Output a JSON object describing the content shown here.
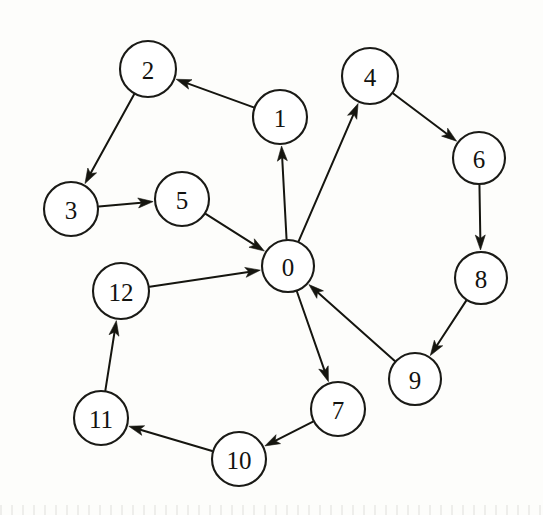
{
  "figure": {
    "name": "directed-graph",
    "width": 543,
    "height": 515,
    "background_color": "#fdfdfb",
    "stroke_color": "#15150f",
    "node_fill_color": "#ffffff"
  },
  "chart_data": {
    "type": "diagram",
    "subtype": "directed-graph",
    "title": "",
    "directed": true,
    "node_count": 13,
    "edge_count": 15,
    "nodes": [
      {
        "id": "0",
        "label": "0",
        "x": 288,
        "y": 266,
        "r": 26
      },
      {
        "id": "1",
        "label": "1",
        "x": 280,
        "y": 117,
        "r": 27
      },
      {
        "id": "2",
        "label": "2",
        "x": 148,
        "y": 69,
        "r": 28
      },
      {
        "id": "3",
        "label": "3",
        "x": 71,
        "y": 209,
        "r": 27
      },
      {
        "id": "4",
        "label": "4",
        "x": 370,
        "y": 76,
        "r": 28
      },
      {
        "id": "5",
        "label": "5",
        "x": 182,
        "y": 199,
        "r": 27
      },
      {
        "id": "6",
        "label": "6",
        "x": 479,
        "y": 158,
        "r": 26
      },
      {
        "id": "7",
        "label": "7",
        "x": 338,
        "y": 409,
        "r": 27
      },
      {
        "id": "8",
        "label": "8",
        "x": 481,
        "y": 278,
        "r": 26
      },
      {
        "id": "9",
        "label": "9",
        "x": 415,
        "y": 379,
        "r": 26
      },
      {
        "id": "10",
        "label": "10",
        "x": 239,
        "y": 459,
        "r": 27
      },
      {
        "id": "11",
        "label": "11",
        "x": 101,
        "y": 418,
        "r": 27
      },
      {
        "id": "12",
        "label": "12",
        "x": 121,
        "y": 291,
        "r": 28
      }
    ],
    "edges": [
      {
        "from": "1",
        "to": "2"
      },
      {
        "from": "2",
        "to": "3"
      },
      {
        "from": "3",
        "to": "5"
      },
      {
        "from": "5",
        "to": "0"
      },
      {
        "from": "0",
        "to": "1"
      },
      {
        "from": "0",
        "to": "4"
      },
      {
        "from": "4",
        "to": "6"
      },
      {
        "from": "6",
        "to": "8"
      },
      {
        "from": "8",
        "to": "9"
      },
      {
        "from": "9",
        "to": "0"
      },
      {
        "from": "0",
        "to": "7"
      },
      {
        "from": "7",
        "to": "10"
      },
      {
        "from": "10",
        "to": "11"
      },
      {
        "from": "11",
        "to": "12"
      },
      {
        "from": "12",
        "to": "0"
      }
    ]
  }
}
